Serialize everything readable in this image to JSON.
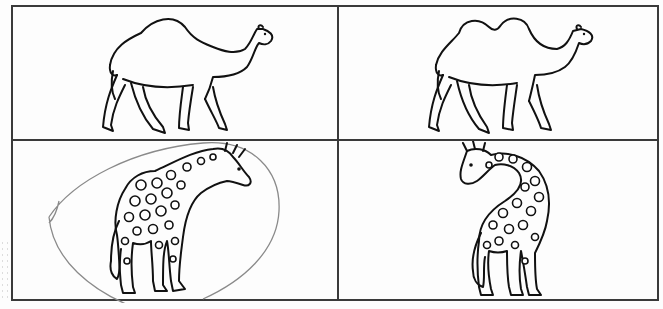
{
  "worksheet": {
    "layout": "2x2 table",
    "cells": [
      {
        "row": 1,
        "col": 1,
        "subject": "camel",
        "variant": "one hump (dromedary)",
        "facing": "right",
        "marked": false
      },
      {
        "row": 1,
        "col": 2,
        "subject": "camel",
        "variant": "two humps (bactrian)",
        "facing": "right",
        "marked": false
      },
      {
        "row": 2,
        "col": 1,
        "subject": "giraffe",
        "variant": "neck arched forward, head right",
        "facing": "right",
        "marked": true,
        "mark": "pencil circle"
      },
      {
        "row": 2,
        "col": 2,
        "subject": "giraffe",
        "variant": "neck curved back, head left",
        "facing": "left",
        "marked": false
      }
    ],
    "colors": {
      "ink": "#111111",
      "border": "#3a3a3a",
      "pencil_mark": "#8a8a8a",
      "paper": "#fdfdfd"
    }
  }
}
